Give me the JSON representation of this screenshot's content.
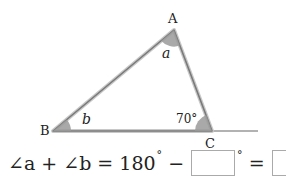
{
  "figure": {
    "vertices": {
      "A": {
        "label": "A",
        "x": 174,
        "y": 30
      },
      "B": {
        "label": "B",
        "x": 53,
        "y": 131
      },
      "C": {
        "label": "C",
        "x": 212,
        "y": 131
      }
    },
    "angle_labels": {
      "a": "a",
      "b": "b",
      "c": "70°"
    },
    "colors": {
      "line": "#888888",
      "arc_fill": "#9a9a9a"
    }
  },
  "equation": {
    "part1": "∠a + ∠b = 180",
    "deg1": "°",
    "minus": " − ",
    "blank1": "",
    "deg2": "°",
    "equals": " = ",
    "blank2": "",
    "deg3": "°"
  }
}
